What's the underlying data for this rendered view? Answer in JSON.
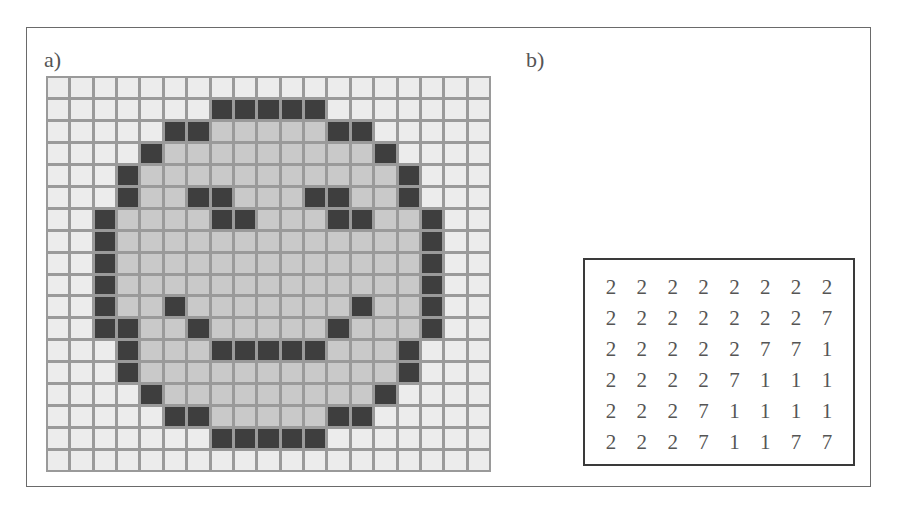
{
  "panel_a": {
    "label": "a)",
    "grid_size": {
      "cols": 19,
      "rows": 18
    },
    "legend": {
      "0": "background (light)",
      "1": "face fill (grey)",
      "2": "outline/features (dark)"
    },
    "colors": {
      "light": "#ececec",
      "grey": "#c9c9c9",
      "dark": "#3e3e3e",
      "gridline": "#9a9a9a"
    },
    "cells": [
      "0000000000000000000",
      "0000000222220000000",
      "0000022111112200000",
      "0000211111111120000",
      "0002111111111112000",
      "0002112211122112000",
      "0021111221112211200",
      "0021111111111111200",
      "0021111111111111200",
      "0021111111111111200",
      "0021121111111211200",
      "0022112111112111200",
      "0002111222221112000",
      "0002111111111112000",
      "0000211111111120000",
      "0000022111112200000",
      "0000000222220000000",
      "0000000000000000000"
    ]
  },
  "panel_b": {
    "label": "b)",
    "matrix": [
      [
        "2",
        "2",
        "2",
        "2",
        "2",
        "2",
        "2",
        "2"
      ],
      [
        "2",
        "2",
        "2",
        "2",
        "2",
        "2",
        "2",
        "7"
      ],
      [
        "2",
        "2",
        "2",
        "2",
        "2",
        "7",
        "7",
        "1"
      ],
      [
        "2",
        "2",
        "2",
        "2",
        "7",
        "1",
        "1",
        "1"
      ],
      [
        "2",
        "2",
        "2",
        "7",
        "1",
        "1",
        "1",
        "1"
      ],
      [
        "2",
        "2",
        "2",
        "7",
        "1",
        "1",
        "7",
        "7"
      ]
    ]
  }
}
